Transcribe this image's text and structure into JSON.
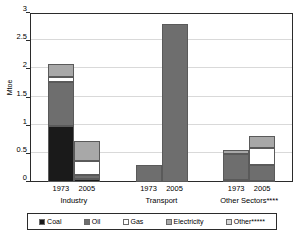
{
  "chart_data": {
    "type": "bar",
    "subtype": "stacked-grouped",
    "title": "",
    "xlabel": "",
    "ylabel": "Mtoe",
    "ylim": [
      0,
      3
    ],
    "yticks": [
      0,
      0.5,
      1,
      1.5,
      2,
      2.5,
      3
    ],
    "ytick_labels": [
      "0",
      "0.5",
      "1",
      "1.5",
      "2",
      "2.5",
      "3"
    ],
    "grid": true,
    "legend_position": "bottom",
    "groups": [
      {
        "name": "Industry",
        "label": "Industry",
        "bars": [
          {
            "year": "1973",
            "total": 2.1,
            "segments": [
              {
                "series": "Coal",
                "value": 1.0
              },
              {
                "series": "Oil",
                "value": 0.77
              },
              {
                "series": "Gas",
                "value": 0.1
              },
              {
                "series": "Electricity",
                "value": 0.23
              },
              {
                "series": "Other",
                "value": 0.0
              }
            ]
          },
          {
            "year": "2005",
            "total": 0.72,
            "segments": [
              {
                "series": "Coal",
                "value": 0.06
              },
              {
                "series": "Oil",
                "value": 0.07
              },
              {
                "series": "Gas",
                "value": 0.24
              },
              {
                "series": "Electricity",
                "value": 0.35
              },
              {
                "series": "Other",
                "value": 0.0
              }
            ]
          }
        ]
      },
      {
        "name": "Transport",
        "label": "Transport",
        "bars": [
          {
            "year": "1973",
            "total": 0.3,
            "segments": [
              {
                "series": "Coal",
                "value": 0.0
              },
              {
                "series": "Oil",
                "value": 0.3
              },
              {
                "series": "Gas",
                "value": 0.0
              },
              {
                "series": "Electricity",
                "value": 0.0
              },
              {
                "series": "Other",
                "value": 0.0
              }
            ]
          },
          {
            "year": "2005",
            "total": 2.8,
            "segments": [
              {
                "series": "Coal",
                "value": 0.0
              },
              {
                "series": "Oil",
                "value": 2.8
              },
              {
                "series": "Gas",
                "value": 0.0
              },
              {
                "series": "Electricity",
                "value": 0.0
              },
              {
                "series": "Other",
                "value": 0.0
              }
            ]
          }
        ]
      },
      {
        "name": "Other Sectors",
        "label": "Other Sectors****",
        "bars": [
          {
            "year": "1973",
            "total": 0.57,
            "segments": [
              {
                "series": "Coal",
                "value": 0.03
              },
              {
                "series": "Oil",
                "value": 0.46
              },
              {
                "series": "Gas",
                "value": 0.0
              },
              {
                "series": "Electricity",
                "value": 0.08
              },
              {
                "series": "Other",
                "value": 0.0
              }
            ]
          },
          {
            "year": "2005",
            "total": 0.82,
            "segments": [
              {
                "series": "Coal",
                "value": 0.02
              },
              {
                "series": "Oil",
                "value": 0.28
              },
              {
                "series": "Gas",
                "value": 0.3
              },
              {
                "series": "Electricity",
                "value": 0.22
              },
              {
                "series": "Other",
                "value": 0.0
              }
            ]
          }
        ]
      }
    ],
    "series": [
      {
        "name": "Coal",
        "label": "Coal",
        "color": "#1a1a1a"
      },
      {
        "name": "Oil",
        "label": "Oil",
        "color": "#6e6e6e"
      },
      {
        "name": "Gas",
        "label": "Gas",
        "color": "#ffffff"
      },
      {
        "name": "Electricity",
        "label": "Electricity",
        "color": "#a8a8a8"
      },
      {
        "name": "Other",
        "label": "Other*****",
        "color": "#d7d7d7"
      }
    ]
  },
  "legend": {
    "items": [
      {
        "label": "Coal",
        "color": "#1a1a1a"
      },
      {
        "label": "Oil",
        "color": "#6e6e6e"
      },
      {
        "label": "Gas",
        "color": "#ffffff"
      },
      {
        "label": "Electricity",
        "color": "#a8a8a8"
      },
      {
        "label": "Other*****",
        "color": "#d7d7d7"
      }
    ]
  },
  "axis": {
    "y_title": "Mtoe"
  }
}
